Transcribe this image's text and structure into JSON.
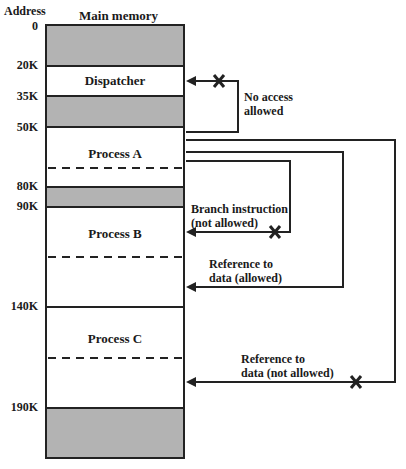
{
  "header": {
    "address_label": "Address",
    "memory_label": "Main memory"
  },
  "addresses": [
    "0",
    "20K",
    "35K",
    "50K",
    "80K",
    "90K",
    "140K",
    "190K"
  ],
  "segments": [
    {
      "name": "reserved-0",
      "start": "0",
      "end": "20K",
      "fill": "gray",
      "label": ""
    },
    {
      "name": "dispatcher",
      "start": "20K",
      "end": "35K",
      "fill": "white",
      "label": "Dispatcher"
    },
    {
      "name": "reserved-35k",
      "start": "35K",
      "end": "50K",
      "fill": "gray",
      "label": ""
    },
    {
      "name": "process-a",
      "start": "50K",
      "end": "80K",
      "fill": "white",
      "label": "Process A"
    },
    {
      "name": "reserved-80k",
      "start": "80K",
      "end": "90K",
      "fill": "gray",
      "label": ""
    },
    {
      "name": "process-b",
      "start": "90K",
      "end": "140K",
      "fill": "white",
      "label": "Process B"
    },
    {
      "name": "process-c",
      "start": "140K",
      "end": "190K",
      "fill": "white",
      "label": "Process C"
    },
    {
      "name": "reserved-190k",
      "start": "190K",
      "end": "",
      "fill": "gray",
      "label": ""
    }
  ],
  "arrows": [
    {
      "label_line1": "No access",
      "label_line2": "allowed",
      "blocked": true,
      "target": "Dispatcher"
    },
    {
      "label_line1": "Branch instruction",
      "label_line2": "(not allowed)",
      "blocked": true,
      "target": "Process B"
    },
    {
      "label_line1": "Reference to",
      "label_line2": "data (allowed)",
      "blocked": false,
      "target": "Process B data"
    },
    {
      "label_line1": "Reference to",
      "label_line2": "data (not allowed)",
      "blocked": true,
      "target": "Process C data"
    }
  ],
  "colors": {
    "reserved": "#b3b3b3",
    "line": "#222222",
    "background": "#ffffff"
  }
}
